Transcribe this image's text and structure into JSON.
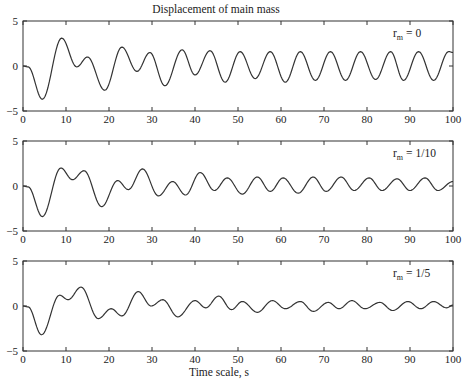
{
  "chart_data": [
    {
      "type": "line",
      "title": "Displacement of main mass",
      "xlabel": "",
      "ylabel": "",
      "annotation": {
        "main": "r",
        "sub": "m",
        "value": "= 0"
      },
      "xlim": [
        0,
        100
      ],
      "ylim": [
        -5,
        5
      ],
      "xticks": [
        0,
        10,
        20,
        30,
        40,
        50,
        60,
        70,
        80,
        90,
        100
      ],
      "yticks": [
        -5,
        0,
        5
      ],
      "grid": false,
      "series": [
        {
          "name": "r_m = 0",
          "extrema": [
            [
              0,
              0
            ],
            [
              1.2,
              -0.1
            ],
            [
              4.5,
              -3.7
            ],
            [
              9,
              3.1
            ],
            [
              12.5,
              -0.1
            ],
            [
              15,
              1.0
            ],
            [
              19,
              -2.7
            ],
            [
              23,
              2.1
            ],
            [
              26.5,
              -0.6
            ],
            [
              29.5,
              1.5
            ],
            [
              33,
              -2.2
            ],
            [
              37,
              1.8
            ],
            [
              40,
              -1.0
            ],
            [
              43.5,
              1.7
            ],
            [
              47,
              -1.8
            ],
            [
              50.5,
              1.6
            ],
            [
              54,
              -1.4
            ],
            [
              57.5,
              1.6
            ],
            [
              61,
              -1.8
            ],
            [
              64.5,
              1.6
            ],
            [
              68,
              -1.6
            ],
            [
              71.5,
              1.6
            ],
            [
              75,
              -1.6
            ],
            [
              78.5,
              1.6
            ],
            [
              82,
              -1.5
            ],
            [
              85.5,
              1.6
            ],
            [
              88.5,
              -1.6
            ],
            [
              92,
              1.6
            ],
            [
              95.5,
              -1.6
            ],
            [
              99,
              1.6
            ],
            [
              100,
              1.5
            ]
          ]
        }
      ]
    },
    {
      "type": "line",
      "title": "",
      "xlabel": "",
      "ylabel": "",
      "annotation": {
        "main": "r",
        "sub": "m",
        "value": "= 1/10"
      },
      "xlim": [
        0,
        100
      ],
      "ylim": [
        -5,
        5
      ],
      "xticks": [
        0,
        10,
        20,
        30,
        40,
        50,
        60,
        70,
        80,
        90,
        100
      ],
      "yticks": [
        -5,
        0,
        5
      ],
      "grid": false,
      "series": [
        {
          "name": "r_m = 1/10",
          "extrema": [
            [
              0,
              0
            ],
            [
              1.2,
              -0.1
            ],
            [
              4.5,
              -3.4
            ],
            [
              8.8,
              2.0
            ],
            [
              11.5,
              0.7
            ],
            [
              14.2,
              1.7
            ],
            [
              18.3,
              -2.3
            ],
            [
              22,
              0.6
            ],
            [
              24.5,
              -0.4
            ],
            [
              27.8,
              1.9
            ],
            [
              31.5,
              -1.1
            ],
            [
              34.8,
              0.5
            ],
            [
              37.8,
              -1.0
            ],
            [
              41.2,
              1.5
            ],
            [
              44.5,
              -0.5
            ],
            [
              47.5,
              0.9
            ],
            [
              51,
              -0.9
            ],
            [
              54.5,
              1.0
            ],
            [
              57.5,
              -0.6
            ],
            [
              60.5,
              0.9
            ],
            [
              64,
              -0.8
            ],
            [
              67.5,
              1.0
            ],
            [
              70.5,
              -0.6
            ],
            [
              74,
              1.0
            ],
            [
              77,
              -0.5
            ],
            [
              80.5,
              0.9
            ],
            [
              83.5,
              -0.5
            ],
            [
              87,
              0.8
            ],
            [
              90,
              -0.5
            ],
            [
              93.5,
              0.9
            ],
            [
              96.5,
              -0.5
            ],
            [
              100,
              0.5
            ]
          ]
        }
      ]
    },
    {
      "type": "line",
      "title": "",
      "xlabel": "Time scale, s",
      "ylabel": "",
      "annotation": {
        "main": "r",
        "sub": "m",
        "value": "= 1/5"
      },
      "xlim": [
        0,
        100
      ],
      "ylim": [
        -5,
        5
      ],
      "xticks": [
        0,
        10,
        20,
        30,
        40,
        50,
        60,
        70,
        80,
        90,
        100
      ],
      "yticks": [
        -5,
        0,
        5
      ],
      "grid": false,
      "series": [
        {
          "name": "r_m = 1/5",
          "extrema": [
            [
              0,
              0
            ],
            [
              1.2,
              -0.1
            ],
            [
              4.3,
              -3.2
            ],
            [
              8.5,
              1.2
            ],
            [
              10.5,
              0.7
            ],
            [
              13.5,
              2.1
            ],
            [
              17.5,
              -1.4
            ],
            [
              20.5,
              -0.3
            ],
            [
              23,
              -1.1
            ],
            [
              26.8,
              1.6
            ],
            [
              29.8,
              0.0
            ],
            [
              32.5,
              0.7
            ],
            [
              36,
              -1.2
            ],
            [
              40,
              0.6
            ],
            [
              42.5,
              -0.2
            ],
            [
              45.5,
              1.1
            ],
            [
              48.5,
              -0.4
            ],
            [
              51,
              0.5
            ],
            [
              54.5,
              -0.7
            ],
            [
              58,
              0.6
            ],
            [
              61,
              -0.3
            ],
            [
              64.5,
              0.5
            ],
            [
              67.5,
              -0.6
            ],
            [
              71,
              0.4
            ],
            [
              73.5,
              -0.3
            ],
            [
              76.5,
              0.6
            ],
            [
              79.5,
              -0.3
            ],
            [
              83,
              0.4
            ],
            [
              86,
              -0.5
            ],
            [
              89.5,
              0.5
            ],
            [
              92.5,
              -0.3
            ],
            [
              95.5,
              0.5
            ],
            [
              98.5,
              -0.2
            ],
            [
              100,
              0.1
            ]
          ]
        }
      ]
    }
  ],
  "figure": {
    "title": "Displacement of main mass",
    "xlabel": "Time scale, s",
    "panels": [
      {
        "id": "panel-rm-0",
        "label_main": "r",
        "label_sub": "m",
        "label_value": "= 0"
      },
      {
        "id": "panel-rm-1-10",
        "label_main": "r",
        "label_sub": "m",
        "label_value": "= 1/10"
      },
      {
        "id": "panel-rm-1-5",
        "label_main": "r",
        "label_sub": "m",
        "label_value": "= 1/5"
      }
    ],
    "ytick_labels": [
      "5",
      "0",
      "−5"
    ],
    "xtick_labels": [
      "0",
      "10",
      "20",
      "30",
      "40",
      "50",
      "60",
      "70",
      "80",
      "90",
      "100"
    ]
  }
}
